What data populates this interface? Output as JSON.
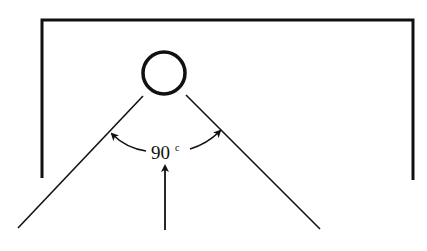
{
  "diagram": {
    "type": "line-drawing",
    "angle_label": {
      "value": "90",
      "unit": "c"
    },
    "colors": {
      "stroke": "#111111",
      "background": "#ffffff"
    }
  }
}
